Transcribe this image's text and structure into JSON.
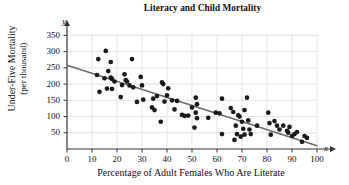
{
  "chart_data": {
    "type": "scatter",
    "title": "Literacy and Child Mortality",
    "xlabel": "Percentage of Adult Females Who Are Literate",
    "ylabel_line1": "Under-Five Mortality",
    "ylabel_line2": "(per thousand)",
    "x_axis_symbol": "x",
    "y_axis_symbol": "y",
    "xlim": [
      0,
      100
    ],
    "ylim": [
      0,
      365
    ],
    "xticks": [
      0,
      10,
      20,
      30,
      40,
      50,
      60,
      70,
      80,
      90,
      100
    ],
    "yticks": [
      50,
      100,
      150,
      200,
      250,
      300,
      350
    ],
    "grid": true,
    "legend": "none",
    "point_color": "#1a1a1a",
    "line_color": "#6b6b6b",
    "grid_color": "#d8d8d8",
    "axis_color": "#333333",
    "trend_line": {
      "type": "linear-regression",
      "x_start": 0,
      "y_start": 258,
      "x_end": 100,
      "y_end": 10
    },
    "points": [
      {
        "x": 12,
        "y": 228
      },
      {
        "x": 12.5,
        "y": 277
      },
      {
        "x": 13,
        "y": 176
      },
      {
        "x": 15,
        "y": 218
      },
      {
        "x": 15.5,
        "y": 302
      },
      {
        "x": 16,
        "y": 186
      },
      {
        "x": 16.5,
        "y": 240
      },
      {
        "x": 17.5,
        "y": 268
      },
      {
        "x": 17.5,
        "y": 220
      },
      {
        "x": 18,
        "y": 216
      },
      {
        "x": 18,
        "y": 185
      },
      {
        "x": 19,
        "y": 208
      },
      {
        "x": 21.5,
        "y": 160
      },
      {
        "x": 22,
        "y": 197
      },
      {
        "x": 23,
        "y": 230
      },
      {
        "x": 23.5,
        "y": 212
      },
      {
        "x": 24,
        "y": 208
      },
      {
        "x": 25,
        "y": 196
      },
      {
        "x": 26,
        "y": 277
      },
      {
        "x": 26.5,
        "y": 190
      },
      {
        "x": 28,
        "y": 145
      },
      {
        "x": 29.5,
        "y": 222
      },
      {
        "x": 30,
        "y": 196
      },
      {
        "x": 30.5,
        "y": 152
      },
      {
        "x": 34,
        "y": 128
      },
      {
        "x": 34.5,
        "y": 155
      },
      {
        "x": 35,
        "y": 120
      },
      {
        "x": 36,
        "y": 163
      },
      {
        "x": 37.5,
        "y": 84
      },
      {
        "x": 38,
        "y": 205
      },
      {
        "x": 38.5,
        "y": 200
      },
      {
        "x": 39,
        "y": 146
      },
      {
        "x": 40,
        "y": 165
      },
      {
        "x": 40.5,
        "y": 187
      },
      {
        "x": 42,
        "y": 150
      },
      {
        "x": 43,
        "y": 122
      },
      {
        "x": 44,
        "y": 148
      },
      {
        "x": 46,
        "y": 105
      },
      {
        "x": 47,
        "y": 102
      },
      {
        "x": 48.5,
        "y": 103
      },
      {
        "x": 50,
        "y": 128
      },
      {
        "x": 51,
        "y": 66
      },
      {
        "x": 51.5,
        "y": 158
      },
      {
        "x": 51.5,
        "y": 112
      },
      {
        "x": 52,
        "y": 138
      },
      {
        "x": 52,
        "y": 95
      },
      {
        "x": 56.5,
        "y": 96
      },
      {
        "x": 59.5,
        "y": 112
      },
      {
        "x": 61,
        "y": 110
      },
      {
        "x": 62,
        "y": 155
      },
      {
        "x": 62,
        "y": 46
      },
      {
        "x": 65.5,
        "y": 126
      },
      {
        "x": 66.5,
        "y": 114
      },
      {
        "x": 67,
        "y": 28
      },
      {
        "x": 67.5,
        "y": 72
      },
      {
        "x": 68,
        "y": 46
      },
      {
        "x": 68.5,
        "y": 104
      },
      {
        "x": 69,
        "y": 100
      },
      {
        "x": 69.5,
        "y": 38
      },
      {
        "x": 70,
        "y": 84
      },
      {
        "x": 70.5,
        "y": 62
      },
      {
        "x": 71,
        "y": 120
      },
      {
        "x": 71,
        "y": 44
      },
      {
        "x": 72,
        "y": 158
      },
      {
        "x": 72.5,
        "y": 88
      },
      {
        "x": 73,
        "y": 60
      },
      {
        "x": 73.5,
        "y": 46
      },
      {
        "x": 76,
        "y": 72
      },
      {
        "x": 80.5,
        "y": 112
      },
      {
        "x": 81,
        "y": 80
      },
      {
        "x": 81.5,
        "y": 44
      },
      {
        "x": 83,
        "y": 86
      },
      {
        "x": 84,
        "y": 72
      },
      {
        "x": 85,
        "y": 60
      },
      {
        "x": 86.5,
        "y": 72
      },
      {
        "x": 88,
        "y": 56
      },
      {
        "x": 88.5,
        "y": 50
      },
      {
        "x": 89,
        "y": 68
      },
      {
        "x": 90,
        "y": 40
      },
      {
        "x": 91,
        "y": 46
      },
      {
        "x": 92,
        "y": 52
      },
      {
        "x": 94,
        "y": 22
      },
      {
        "x": 95,
        "y": 40
      },
      {
        "x": 96,
        "y": 34
      }
    ]
  }
}
